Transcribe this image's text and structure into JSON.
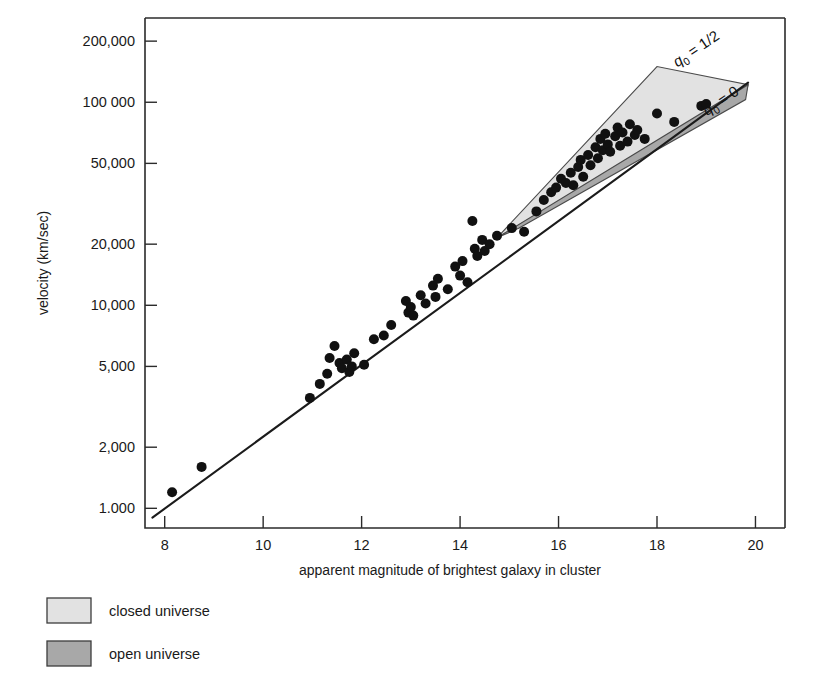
{
  "chart_data": {
    "type": "scatter",
    "title": "",
    "xlabel": "apparent magnitude of brightest galaxy in cluster",
    "ylabel": "velocity (km/sec)",
    "xlim": [
      7.6,
      20.6
    ],
    "ylim": [
      800,
      260000
    ],
    "yscale": "log",
    "grid": false,
    "xticks": [
      8,
      10,
      12,
      14,
      16,
      18,
      20
    ],
    "xtick_labels": [
      "8",
      "10",
      "12",
      "14",
      "16",
      "18",
      "20"
    ],
    "yticks": [
      1000,
      2000,
      5000,
      10000,
      20000,
      50000,
      100000,
      200000
    ],
    "ytick_labels": [
      "1.000",
      "2,000",
      "5,000",
      "10,000",
      "20,000",
      "50,000",
      "100 000",
      "200,000"
    ],
    "series": [
      {
        "name": "galaxy clusters",
        "marker": "filled-circle",
        "color": "#111111",
        "points": [
          [
            8.15,
            1200
          ],
          [
            8.75,
            1600
          ],
          [
            10.95,
            3500
          ],
          [
            11.15,
            4100
          ],
          [
            11.3,
            4600
          ],
          [
            11.35,
            5500
          ],
          [
            11.45,
            6300
          ],
          [
            11.55,
            5200
          ],
          [
            11.6,
            4900
          ],
          [
            11.7,
            5400
          ],
          [
            11.75,
            4700
          ],
          [
            11.8,
            5000
          ],
          [
            11.85,
            5800
          ],
          [
            12.05,
            5100
          ],
          [
            12.25,
            6800
          ],
          [
            12.45,
            7100
          ],
          [
            12.6,
            8000
          ],
          [
            12.9,
            10500
          ],
          [
            12.95,
            9200
          ],
          [
            13.0,
            9800
          ],
          [
            13.05,
            8900
          ],
          [
            13.2,
            11200
          ],
          [
            13.3,
            10200
          ],
          [
            13.45,
            12500
          ],
          [
            13.5,
            11000
          ],
          [
            13.55,
            13500
          ],
          [
            13.75,
            12000
          ],
          [
            13.9,
            15500
          ],
          [
            14.0,
            14000
          ],
          [
            14.05,
            16500
          ],
          [
            14.15,
            13000
          ],
          [
            14.25,
            26000
          ],
          [
            14.3,
            19000
          ],
          [
            14.35,
            17500
          ],
          [
            14.45,
            21000
          ],
          [
            14.5,
            18500
          ],
          [
            14.6,
            20000
          ],
          [
            14.75,
            22000
          ],
          [
            15.05,
            24000
          ],
          [
            15.3,
            23000
          ],
          [
            15.55,
            29000
          ],
          [
            15.7,
            33000
          ],
          [
            15.85,
            36000
          ],
          [
            15.95,
            38000
          ],
          [
            16.05,
            42000
          ],
          [
            16.15,
            40000
          ],
          [
            16.25,
            45000
          ],
          [
            16.3,
            39000
          ],
          [
            16.4,
            48000
          ],
          [
            16.45,
            52000
          ],
          [
            16.5,
            43000
          ],
          [
            16.6,
            55000
          ],
          [
            16.65,
            49000
          ],
          [
            16.75,
            60000
          ],
          [
            16.8,
            53000
          ],
          [
            16.85,
            66000
          ],
          [
            16.9,
            58000
          ],
          [
            16.95,
            70000
          ],
          [
            17.0,
            62000
          ],
          [
            17.05,
            57000
          ],
          [
            17.15,
            68000
          ],
          [
            17.2,
            75000
          ],
          [
            17.25,
            61000
          ],
          [
            17.3,
            71000
          ],
          [
            17.4,
            64000
          ],
          [
            17.45,
            78000
          ],
          [
            17.55,
            69000
          ],
          [
            17.6,
            73000
          ],
          [
            17.75,
            66000
          ],
          [
            18.0,
            88000
          ],
          [
            18.35,
            80000
          ],
          [
            18.9,
            96000
          ],
          [
            19.0,
            98000
          ]
        ]
      }
    ],
    "fit_line": {
      "name": "hubble-relation",
      "points": [
        [
          7.75,
          900
        ],
        [
          19.85,
          125000
        ]
      ]
    },
    "regions": [
      {
        "name": "closed universe",
        "key": "closed",
        "fill": "#e2e2e2",
        "vertices": [
          [
            14.75,
            21500
          ],
          [
            18.0,
            150000
          ],
          [
            19.85,
            122000
          ],
          [
            19.8,
            110000
          ]
        ]
      },
      {
        "name": "open universe",
        "key": "open",
        "fill": "#a8a8a8",
        "vertices": [
          [
            14.75,
            21500
          ],
          [
            19.85,
            122000
          ],
          [
            19.8,
            103000
          ],
          [
            15.2,
            24000
          ]
        ]
      }
    ],
    "annotations": [
      {
        "name": "q0-half-label",
        "text": "q",
        "sub": "0",
        "tail": " = 1/2",
        "x": 18.85,
        "y": 175000,
        "rotation": -34
      },
      {
        "name": "q0-zero-label",
        "text": "q",
        "sub": "0",
        "tail": " = 0",
        "x": 19.35,
        "y": 97000,
        "rotation": -34
      }
    ],
    "legend": {
      "position": "below-axes-left",
      "entries": [
        {
          "label": "closed universe",
          "color": "#e2e2e2"
        },
        {
          "label": "open universe",
          "color": "#a8a8a8"
        }
      ]
    }
  }
}
